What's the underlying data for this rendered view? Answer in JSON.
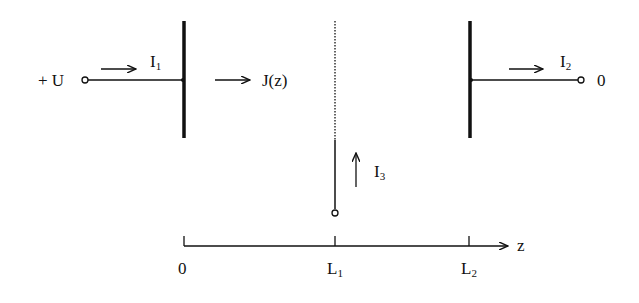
{
  "diagram": {
    "type": "electrode-current-schematic",
    "colors": {
      "ink": "#111111",
      "background": "#ffffff"
    },
    "terminals": {
      "input": {
        "label": "+ U"
      },
      "output": {
        "label": "0"
      }
    },
    "currents": {
      "i1": {
        "main": "I",
        "sub": "1"
      },
      "i2": {
        "main": "I",
        "sub": "2"
      },
      "i3": {
        "main": "I",
        "sub": "3"
      },
      "j": {
        "label": "J(z)"
      }
    },
    "axis": {
      "label": "z",
      "ticks": [
        {
          "main": "0",
          "sub": ""
        },
        {
          "main": "L",
          "sub": "1"
        },
        {
          "main": "L",
          "sub": "2"
        }
      ]
    }
  }
}
